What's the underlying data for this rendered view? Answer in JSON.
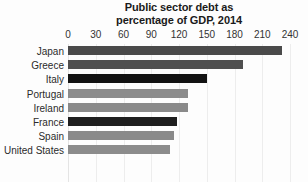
{
  "chart_data": {
    "type": "bar",
    "orientation": "horizontal",
    "title": "Public sector debt as percentage of GDP, 2014",
    "title_lines": [
      "Public sector debt as",
      "percentage of GDP, 2014"
    ],
    "xlabel": "",
    "ylabel": "",
    "xlim": [
      0,
      240
    ],
    "xticks": [
      0,
      30,
      60,
      90,
      120,
      150,
      180,
      210,
      240
    ],
    "xtick_labels": [
      "0",
      "30",
      "60",
      "90",
      "120",
      "150",
      "180",
      "210",
      "240"
    ],
    "grid": true,
    "grid_axis": "x",
    "legend": false,
    "categories": [
      "Japan",
      "Greece",
      "Italy",
      "Portugal",
      "Ireland",
      "France",
      "Spain",
      "United States"
    ],
    "values": [
      231,
      189,
      150,
      130,
      130,
      118,
      115,
      110
    ],
    "bar_colors": [
      "#4a4a4a",
      "#4f4f4f",
      "#121212",
      "#8c8c8c",
      "#8a8a8a",
      "#1e1e1e",
      "#8a8a8a",
      "#8c8c8c"
    ],
    "last_bar_clipped": true
  },
  "colors": {
    "background": "#fdfdfd",
    "gridline": "#ededed",
    "tick_text": "#333333",
    "category_text": "#2b2b2b",
    "title_text": "#1a1a1a",
    "bar_dark": "#121212",
    "bar_mid": "#4a4a4a",
    "bar_light": "#8c8c8c"
  }
}
